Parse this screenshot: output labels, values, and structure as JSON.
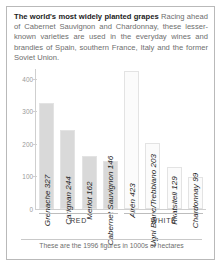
{
  "intro": {
    "headline": "The world's most widely planted grapes",
    "body": " Racing ahead of Cabernet Sauvignon and Chardonnay, these lesser-known varieties are used in the everyday wines and brandies of Spain, southern France, Italy and the former Soviet Union."
  },
  "footnote": "These are the 1996 figures in 1000s of hectares",
  "groups": [
    {
      "label": "RED"
    },
    {
      "label": "WHITE"
    }
  ],
  "chart_data": {
    "type": "bar",
    "title": "The world's most widely planted grapes",
    "xlabel": "",
    "ylabel": "",
    "ylim": [
      0,
      430
    ],
    "yticks": [
      "400",
      "300",
      "200",
      "100",
      "0"
    ],
    "grid": false,
    "legend": "none",
    "units": "1000s of hectares",
    "year": 1996,
    "categories": [
      "Grenache",
      "Carignan",
      "Merlot",
      "Cabernet Sauvignon",
      "Airén",
      "Ugni Blanc/Trebbiano",
      "Rkatsiteli",
      "Chardonnay"
    ],
    "values": [
      327,
      244,
      162,
      146,
      423,
      203,
      129,
      99
    ],
    "bar_labels": [
      "Grenache 327",
      "Carignan 244",
      "Merlot 162",
      "Cabernet Sauvignon 146",
      "Airén 423",
      "Ugni Blanc/Trebbiano 203",
      "Rkatsiteli 129",
      "Chardonnay 99"
    ],
    "group_of": [
      "RED",
      "RED",
      "RED",
      "RED",
      "WHITE",
      "WHITE",
      "WHITE",
      "WHITE"
    ],
    "bar_colors": [
      "#d9d9d9",
      "#d9d9d9",
      "#d9d9d9",
      "#d9d9d9",
      "#fbfbfb",
      "#fbfbfb",
      "#fbfbfb",
      "#fbfbfb"
    ]
  }
}
